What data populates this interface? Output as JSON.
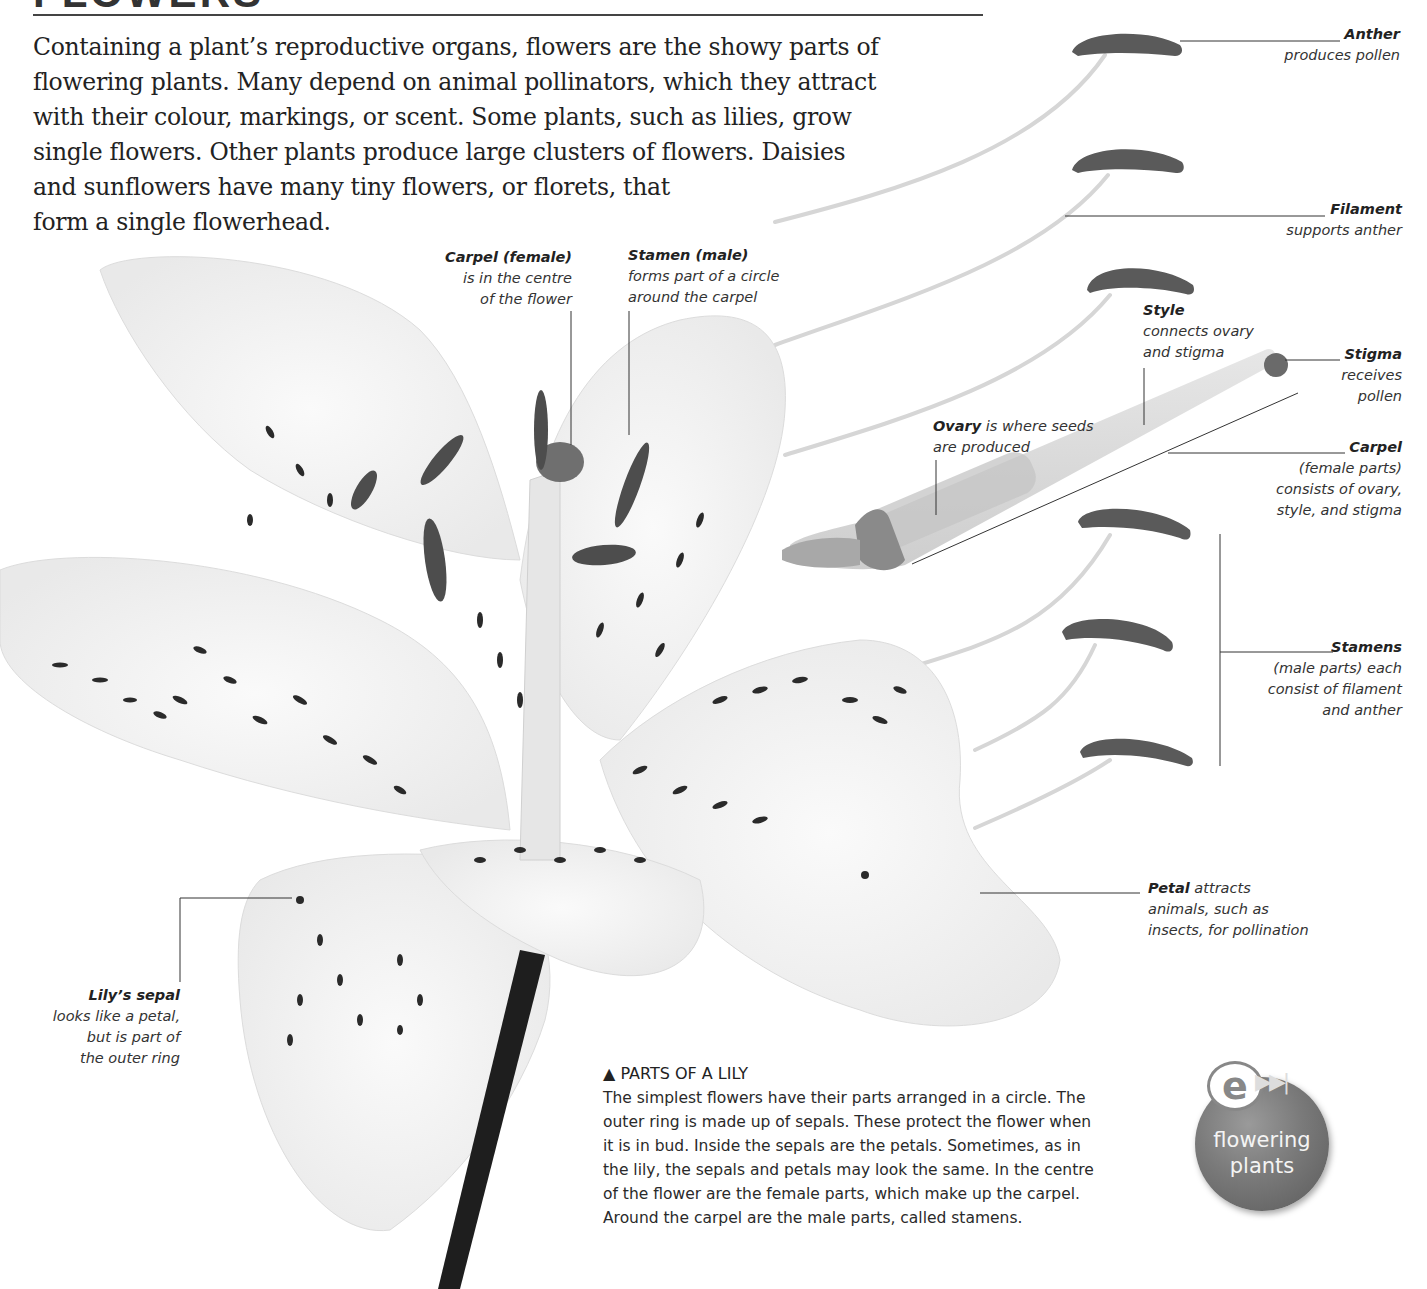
{
  "page": {
    "title": "FLOWERS",
    "intro_lines": [
      "Containing a plant’s reproductive organs, flowers are the showy parts of",
      "flowering plants. Many depend on animal pollinators, which they attract",
      "with their colour, markings, or scent. Some plants, such as lilies, grow",
      "single flowers. Other plants produce large clusters of flowers. Daisies",
      "and sunflowers have many tiny flowers, or florets, that",
      "form a single flowerhead."
    ]
  },
  "labels": {
    "anther": {
      "title": "Anther",
      "lines": [
        "produces pollen"
      ]
    },
    "filament": {
      "title": "Filament",
      "lines": [
        "supports anther"
      ]
    },
    "style": {
      "title": "Style",
      "lines": [
        "connects ovary",
        "and stigma"
      ]
    },
    "stigma": {
      "title": "Stigma",
      "lines": [
        "receives",
        "pollen"
      ]
    },
    "ovary": {
      "title": "Ovary",
      "rest": " is where seeds",
      "lines": [
        "are produced"
      ]
    },
    "carpel": {
      "title": "Carpel",
      "lines": [
        "(female parts)",
        "consists of ovary,",
        "style, and stigma"
      ]
    },
    "stamens": {
      "title": "Stamens",
      "lines": [
        "(male parts) each",
        "consist of filament",
        "and anther"
      ]
    },
    "carpel_female": {
      "title": "Carpel (female)",
      "lines": [
        "is in the centre",
        "of the flower"
      ]
    },
    "stamen_male": {
      "title": "Stamen (male)",
      "lines": [
        "forms part of a circle",
        "around the carpel"
      ]
    },
    "petal": {
      "title": "Petal",
      "rest": " attracts",
      "lines": [
        "animals, such as",
        "insects, for pollination"
      ]
    },
    "sepal": {
      "title": "Lily’s sepal",
      "lines": [
        "looks like a petal,",
        "but is part of",
        "the outer ring"
      ]
    }
  },
  "caption": {
    "marker": "▲",
    "title": "PARTS OF A LILY",
    "lines": [
      "The simplest flowers have their parts arranged in a circle. The",
      "outer ring is made up of sepals. These protect the flower when",
      "it is in bud. Inside the sepals are the petals. Sometimes, as in",
      "the lily, the sepals and petals may look the same. In the centre",
      "of the flower are the female parts, which make up the carpel.",
      "Around the carpel are the male parts, called stamens."
    ]
  },
  "badge": {
    "icon": "e-link-icon",
    "e_glyph": "e",
    "arrows_glyph": "▶▶|",
    "lines": [
      "flowering",
      "plants"
    ]
  },
  "colors": {
    "background": "#ffffff",
    "text": "#222222",
    "anther": "#555555",
    "petal_spot": "#2a2a2a",
    "stem": "#1e1e1e",
    "badge": "#7a7a7a"
  }
}
